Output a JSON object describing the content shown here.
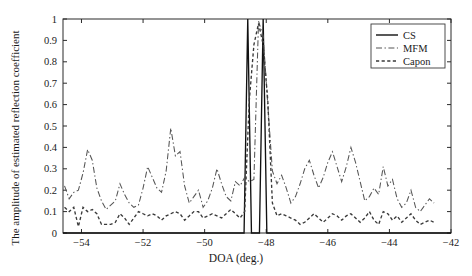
{
  "chart_data": {
    "type": "line",
    "title": "",
    "xlabel": "DOA (deg.)",
    "ylabel": "The amplitude of estimated reflection coefficient",
    "xlim": [
      -54.6,
      -42.0
    ],
    "ylim": [
      0,
      1
    ],
    "xticks": [
      -54,
      -52,
      -50,
      -48,
      -46,
      -44,
      -42
    ],
    "xtick_labels": [
      "−54",
      "−52",
      "−50",
      "−48",
      "−46",
      "−44",
      "−42"
    ],
    "yticks": [
      0,
      0.1,
      0.2,
      0.3,
      0.4,
      0.5,
      0.6,
      0.7,
      0.8,
      0.9,
      1
    ],
    "ytick_labels": [
      "0",
      "0.1",
      "0.2",
      "0.3",
      "0.4",
      "0.5",
      "0.6",
      "0.7",
      "0.8",
      "0.9",
      "1"
    ],
    "grid": false,
    "legend_position": "upper right",
    "legend": [
      "CS",
      "MFM",
      "Capon"
    ],
    "series": [
      {
        "name": "CS",
        "style": "solid",
        "color": "#111111",
        "x": [
          -54.6,
          -48.72,
          -48.66,
          -48.6,
          -48.54,
          -48.48,
          -48.3,
          -48.22,
          -48.16,
          -48.1,
          -48.04,
          -47.98,
          -42.0
        ],
        "values": [
          0,
          0,
          0.5,
          1.0,
          0.5,
          0,
          0,
          0,
          0.5,
          1.0,
          0.5,
          0,
          0
        ]
      },
      {
        "name": "MFM",
        "style": "dashdot",
        "color": "#555555",
        "x": [
          -54.55,
          -54.4,
          -54.25,
          -54.1,
          -53.95,
          -53.8,
          -53.65,
          -53.5,
          -53.35,
          -53.2,
          -53.05,
          -52.9,
          -52.75,
          -52.6,
          -52.45,
          -52.3,
          -52.15,
          -52.0,
          -51.85,
          -51.7,
          -51.55,
          -51.4,
          -51.25,
          -51.1,
          -50.95,
          -50.8,
          -50.65,
          -50.5,
          -50.35,
          -50.2,
          -50.05,
          -49.9,
          -49.75,
          -49.6,
          -49.45,
          -49.3,
          -49.15,
          -49.0,
          -48.85,
          -48.7,
          -48.55,
          -48.4,
          -48.25,
          -48.1,
          -47.95,
          -47.8,
          -47.65,
          -47.5,
          -47.35,
          -47.2,
          -47.05,
          -46.9,
          -46.75,
          -46.6,
          -46.45,
          -46.3,
          -46.15,
          -46.0,
          -45.85,
          -45.7,
          -45.55,
          -45.4,
          -45.25,
          -45.1,
          -44.95,
          -44.8,
          -44.65,
          -44.5,
          -44.35,
          -44.2,
          -44.05,
          -43.9,
          -43.75,
          -43.6,
          -43.45,
          -43.3,
          -43.15,
          -43.0,
          -42.85,
          -42.7,
          -42.55
        ],
        "values": [
          0.22,
          0.16,
          0.19,
          0.2,
          0.28,
          0.39,
          0.34,
          0.21,
          0.15,
          0.11,
          0.13,
          0.15,
          0.23,
          0.18,
          0.14,
          0.12,
          0.13,
          0.21,
          0.31,
          0.26,
          0.21,
          0.19,
          0.29,
          0.49,
          0.36,
          0.38,
          0.22,
          0.14,
          0.17,
          0.2,
          0.12,
          0.15,
          0.21,
          0.3,
          0.23,
          0.17,
          0.15,
          0.24,
          0.22,
          0.26,
          0.24,
          0.25,
          0.99,
          0.92,
          0.6,
          0.29,
          0.23,
          0.27,
          0.21,
          0.14,
          0.17,
          0.23,
          0.3,
          0.34,
          0.27,
          0.21,
          0.26,
          0.33,
          0.38,
          0.31,
          0.24,
          0.31,
          0.4,
          0.33,
          0.24,
          0.15,
          0.17,
          0.21,
          0.18,
          0.31,
          0.22,
          0.25,
          0.16,
          0.12,
          0.14,
          0.2,
          0.12,
          0.1,
          0.13,
          0.16,
          0.14
        ]
      },
      {
        "name": "Capon",
        "style": "dashed",
        "color": "#3a3a3a",
        "x": [
          -54.55,
          -54.4,
          -54.25,
          -54.1,
          -53.95,
          -53.8,
          -53.65,
          -53.5,
          -53.35,
          -53.2,
          -53.05,
          -52.9,
          -52.75,
          -52.6,
          -52.45,
          -52.3,
          -52.15,
          -52.0,
          -51.85,
          -51.7,
          -51.55,
          -51.4,
          -51.25,
          -51.1,
          -50.95,
          -50.8,
          -50.65,
          -50.5,
          -50.35,
          -50.2,
          -50.05,
          -49.9,
          -49.75,
          -49.6,
          -49.45,
          -49.3,
          -49.15,
          -49.0,
          -48.85,
          -48.7,
          -48.55,
          -48.4,
          -48.25,
          -48.1,
          -47.95,
          -47.8,
          -47.65,
          -47.5,
          -47.35,
          -47.2,
          -47.05,
          -46.9,
          -46.75,
          -46.6,
          -46.45,
          -46.3,
          -46.15,
          -46.0,
          -45.85,
          -45.7,
          -45.55,
          -45.4,
          -45.25,
          -45.1,
          -44.95,
          -44.8,
          -44.65,
          -44.5,
          -44.35,
          -44.2,
          -44.05,
          -43.9,
          -43.75,
          -43.6,
          -43.45,
          -43.3,
          -43.15,
          -43.0,
          -42.85,
          -42.7,
          -42.55
        ],
        "values": [
          0.12,
          0.1,
          0.12,
          0.03,
          0.12,
          0.1,
          0.11,
          0.09,
          0.04,
          0.04,
          0.04,
          0.05,
          0.09,
          0.07,
          0.04,
          0.07,
          0.1,
          0.09,
          0.08,
          0.09,
          0.08,
          0.06,
          0.08,
          0.09,
          0.1,
          0.09,
          0.06,
          0.08,
          0.1,
          0.1,
          0.07,
          0.08,
          0.09,
          0.08,
          0.07,
          0.09,
          0.11,
          0.09,
          0.07,
          0.1,
          0.62,
          0.88,
          0.98,
          0.88,
          0.62,
          0.14,
          0.08,
          0.09,
          0.08,
          0.07,
          0.06,
          0.04,
          0.05,
          0.07,
          0.09,
          0.07,
          0.05,
          0.07,
          0.09,
          0.08,
          0.06,
          0.08,
          0.09,
          0.07,
          0.05,
          0.07,
          0.1,
          0.06,
          0.04,
          0.1,
          0.09,
          0.06,
          0.08,
          0.05,
          0.07,
          0.09,
          0.06,
          0.04,
          0.05,
          0.06,
          0.05
        ]
      }
    ]
  },
  "axes": {
    "xlabel": "DOA (deg.)",
    "ylabel": "The amplitude of estimated reflection coefficient"
  },
  "legend": {
    "items": [
      {
        "label": "CS",
        "style": "solid"
      },
      {
        "label": "MFM",
        "style": "dashdot"
      },
      {
        "label": "Capon",
        "style": "dashed"
      }
    ]
  }
}
